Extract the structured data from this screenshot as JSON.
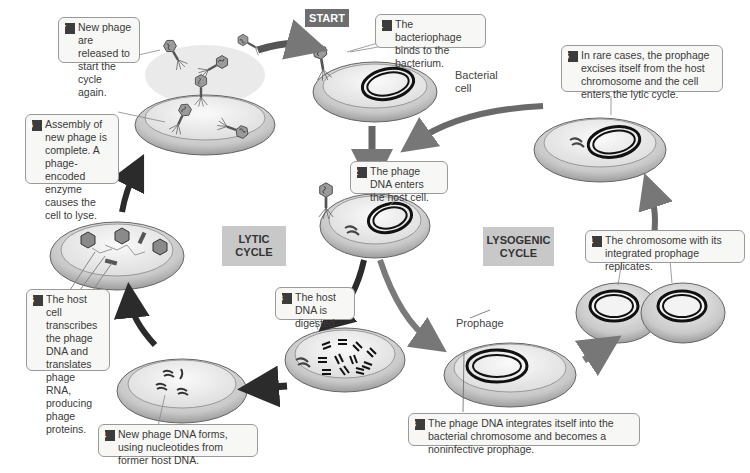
{
  "start_label": "START",
  "cycles": {
    "lytic": "LYTIC\nCYCLE",
    "lysogenic": "LYSOGENIC\nCYCLE"
  },
  "labels": {
    "bacterial_cell": "Bacterial\ncell",
    "prophage": "Prophage"
  },
  "lytic_steps": [
    {
      "num": "1",
      "text": "The bacteriophage binds to the bacterium."
    },
    {
      "num": "2",
      "text": "The phage DNA enters the host cell."
    },
    {
      "num": "3",
      "text": "The host DNA is digested."
    },
    {
      "num": "4",
      "text": "New phage DNA forms, using nucleotides from former host DNA."
    },
    {
      "num": "5",
      "text": "The host cell transcribes the phage DNA and translates phage RNA, producing phage proteins."
    },
    {
      "num": "6",
      "text": "Assembly of new phage is complete. A phage-encoded enzyme causes the cell to lyse."
    },
    {
      "num": "7",
      "text": "New phage are released to start the cycle again."
    }
  ],
  "lysogenic_steps": [
    {
      "num": "3",
      "text": "The phage DNA integrates itself into the bacterial chromosome and becomes a noninfective prophage."
    },
    {
      "num": "4",
      "text": "The chromosome with its integrated prophage replicates."
    },
    {
      "num": "5",
      "text": "In rare cases, the prophage excises itself from the host chromosome and the cell enters the lytic cycle."
    }
  ],
  "colors": {
    "cell_fill": "#d9d9d9",
    "cell_inner": "#ececec",
    "arrow_dark": "#2b2b2b",
    "arrow_gray": "#7a7a7a",
    "start_bg": "#6e6e6e",
    "cycle_bg": "#c8c8c8"
  }
}
